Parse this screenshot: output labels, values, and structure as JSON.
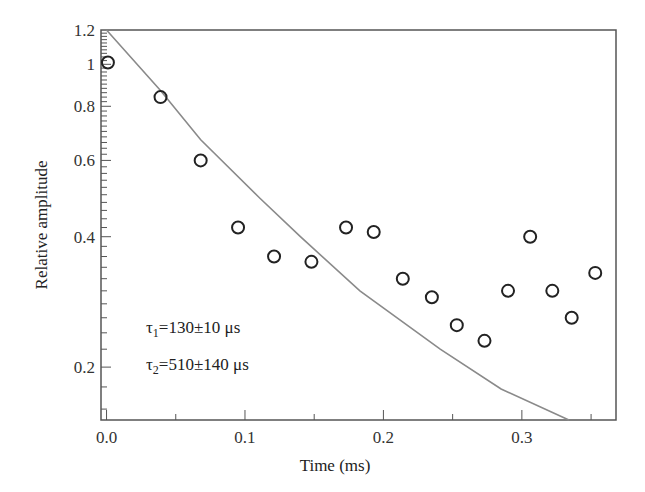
{
  "chart_data": {
    "type": "scatter",
    "title": "",
    "xlabel": "Time (ms)",
    "ylabel": "Relative amplitude",
    "xlim": [
      -0.004,
      0.368
    ],
    "ylim": [
      0.151,
      1.2
    ],
    "yscale": "log",
    "grid": false,
    "x_ticks": [
      0.0,
      0.1,
      0.2,
      0.3
    ],
    "x_tick_labels": [
      "0.0",
      "0.1",
      "0.2",
      "0.3"
    ],
    "y_ticks": [
      0.2,
      0.4,
      0.6,
      0.8,
      1.0,
      1.2
    ],
    "y_tick_labels": [
      "0.2",
      "0.4",
      "0.6",
      "0.8",
      "1",
      "1.2"
    ],
    "series": [
      {
        "name": "Measured",
        "style": "open-circle",
        "color": "#222222",
        "x": [
          0.001,
          0.039,
          0.068,
          0.095,
          0.121,
          0.148,
          0.173,
          0.193,
          0.214,
          0.235,
          0.253,
          0.273,
          0.29,
          0.306,
          0.322,
          0.336,
          0.353
        ],
        "y": [
          1.01,
          0.84,
          0.6,
          0.42,
          0.36,
          0.35,
          0.42,
          0.41,
          0.32,
          0.29,
          0.25,
          0.23,
          0.3,
          0.4,
          0.3,
          0.26,
          0.33
        ]
      },
      {
        "name": "Fit",
        "style": "line",
        "color": "#888888",
        "x": [
          0.0,
          0.039,
          0.068,
          0.111,
          0.14,
          0.183,
          0.241,
          0.285,
          0.334
        ],
        "y": [
          1.2,
          0.87,
          0.67,
          0.49,
          0.4,
          0.3,
          0.22,
          0.178,
          0.151
        ]
      }
    ],
    "annotations": [
      {
        "symbol": "τ",
        "sub": "1",
        "text": "=130±10 μs"
      },
      {
        "symbol": "τ",
        "sub": "2",
        "text": "=510±140 μs"
      }
    ]
  }
}
